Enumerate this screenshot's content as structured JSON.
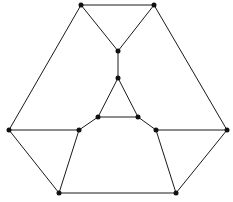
{
  "diagram": {
    "type": "graph",
    "width": 233,
    "height": 202,
    "colors": {
      "edge": "#1a1a1a",
      "node": "#111111",
      "background": "#ffffff"
    },
    "node_radius": 2.5,
    "nodes": [
      {
        "id": "A",
        "x": 81,
        "y": 5
      },
      {
        "id": "B",
        "x": 154,
        "y": 5
      },
      {
        "id": "C",
        "x": 118,
        "y": 51
      },
      {
        "id": "D",
        "x": 118,
        "y": 78
      },
      {
        "id": "E",
        "x": 98,
        "y": 117
      },
      {
        "id": "F",
        "x": 138,
        "y": 117
      },
      {
        "id": "G",
        "x": 79,
        "y": 130
      },
      {
        "id": "H",
        "x": 156,
        "y": 130
      },
      {
        "id": "I",
        "x": 9,
        "y": 130
      },
      {
        "id": "J",
        "x": 227,
        "y": 130
      },
      {
        "id": "K",
        "x": 59,
        "y": 193
      },
      {
        "id": "L",
        "x": 176,
        "y": 193
      }
    ],
    "edges": [
      [
        "A",
        "B"
      ],
      [
        "A",
        "C"
      ],
      [
        "B",
        "C"
      ],
      [
        "C",
        "D"
      ],
      [
        "D",
        "E"
      ],
      [
        "D",
        "F"
      ],
      [
        "E",
        "F"
      ],
      [
        "E",
        "G"
      ],
      [
        "F",
        "H"
      ],
      [
        "A",
        "I"
      ],
      [
        "B",
        "J"
      ],
      [
        "I",
        "G"
      ],
      [
        "H",
        "J"
      ],
      [
        "I",
        "K"
      ],
      [
        "J",
        "L"
      ],
      [
        "G",
        "K"
      ],
      [
        "H",
        "L"
      ],
      [
        "K",
        "L"
      ]
    ]
  }
}
